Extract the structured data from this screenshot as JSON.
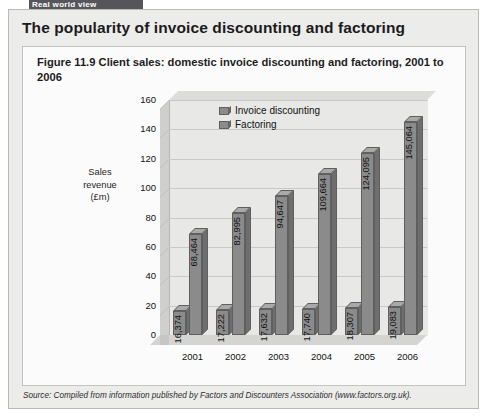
{
  "banner": {
    "label": "Real world view"
  },
  "card": {
    "title": "The popularity of invoice discounting and factoring",
    "caption": "Figure 11.9  Client sales: domestic invoice discounting and factoring, 2001 to 2006",
    "source": "Source: Compiled from information published by Factors and Discounters Association (www.factors.org.uk)."
  },
  "chart_data": {
    "type": "bar",
    "title": "Figure 11.9  Client sales: domestic invoice discounting and factoring, 2001 to 2006",
    "xlabel": "",
    "ylabel": "Sales revenue (£m)",
    "ylabel_lines": [
      "Sales",
      "revenue",
      "(£m)"
    ],
    "categories": [
      "2001",
      "2002",
      "2003",
      "2004",
      "2005",
      "2006"
    ],
    "yticks": [
      "0",
      "20",
      "40",
      "60",
      "80",
      "100",
      "120",
      "140",
      "160"
    ],
    "ylim": [
      0,
      160
    ],
    "grid": true,
    "legend_position": "top-left-inside",
    "series": [
      {
        "name": "Invoice discounting",
        "color": "#8b8b8b",
        "values": [
          16374,
          17222,
          17632,
          17740,
          18307,
          19083
        ],
        "labels": [
          "16,374",
          "17,222",
          "17,632",
          "17,740",
          "18,307",
          "19,083"
        ],
        "plot_values": [
          16.374,
          17.222,
          17.632,
          17.74,
          18.307,
          19.083
        ]
      },
      {
        "name": "Factoring",
        "color": "#8b8b8b",
        "values": [
          68464,
          82995,
          94647,
          109664,
          124095,
          145064
        ],
        "labels": [
          "68,464",
          "82,995",
          "94,647",
          "109,664",
          "124,095",
          "145,064"
        ],
        "plot_values": [
          68.464,
          82.995,
          94.647,
          109.664,
          124.095,
          145.064
        ]
      }
    ]
  }
}
